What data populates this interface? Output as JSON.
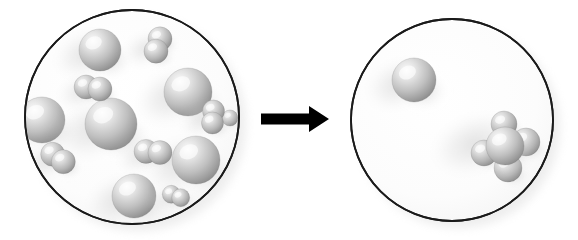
{
  "diagram": {
    "type": "before-after-reaction",
    "canvas": {
      "width": 578,
      "height": 240,
      "background": "#ffffff"
    },
    "palette": {
      "sphere_light": "#f2f2f2",
      "sphere_mid": "#bdbdbd",
      "sphere_dark": "#8a8a8a",
      "sphere_edge": "#6e6e6e",
      "vessel_fill": "#fdfdfd",
      "vessel_stroke": "#1a1a1a",
      "arrow_color": "#000000",
      "shadow_color": "#d9d9d9"
    },
    "arrow": {
      "label": "reacts to form",
      "direction": "right",
      "x1": 261,
      "x2": 329,
      "y": 119,
      "shaft_height": 11,
      "head_width": 20,
      "head_height": 26,
      "color": "#000000"
    },
    "vessels": [
      {
        "id": "reactants",
        "name": "Reactant vessel",
        "caption": "before",
        "cx": 132,
        "cy": 117,
        "r": 107,
        "stroke_width": 1.8,
        "particle_count": 13,
        "single_atom_count": 7,
        "diatomic_count": 6,
        "particles": [
          {
            "kind": "single",
            "cx": 100,
            "cy": 50,
            "r": 21
          },
          {
            "kind": "single",
            "cx": 42,
            "cy": 120,
            "r": 23
          },
          {
            "kind": "single",
            "cx": 111,
            "cy": 124,
            "r": 26
          },
          {
            "kind": "single",
            "cx": 188,
            "cy": 92,
            "r": 24
          },
          {
            "kind": "single",
            "cx": 196,
            "cy": 160,
            "r": 24
          },
          {
            "kind": "single",
            "cx": 134,
            "cy": 196,
            "r": 22
          },
          {
            "kind": "single",
            "cx": 230,
            "cy": 118,
            "r": 8
          },
          {
            "kind": "diatomic",
            "cx": 158,
            "cy": 45,
            "r": 12,
            "angle": 108,
            "sep": 13
          },
          {
            "kind": "diatomic",
            "cx": 93,
            "cy": 88,
            "r": 12,
            "angle": 8,
            "sep": 14
          },
          {
            "kind": "diatomic",
            "cx": 58,
            "cy": 158,
            "r": 12,
            "angle": 35,
            "sep": 13
          },
          {
            "kind": "diatomic",
            "cx": 153,
            "cy": 152,
            "r": 12,
            "angle": 5,
            "sep": 14
          },
          {
            "kind": "diatomic",
            "cx": 213,
            "cy": 117,
            "r": 11,
            "angle": 95,
            "sep": 12
          },
          {
            "kind": "diatomic",
            "cx": 176,
            "cy": 196,
            "r": 9,
            "angle": 20,
            "sep": 10
          }
        ]
      },
      {
        "id": "products",
        "name": "Product vessel",
        "caption": "after",
        "cx": 452,
        "cy": 120,
        "r": 101,
        "stroke_width": 1.8,
        "particle_count": 2,
        "single_atom_count": 1,
        "cluster_count": 1,
        "particles": [
          {
            "kind": "single",
            "cx": 414,
            "cy": 80,
            "r": 22
          },
          {
            "kind": "cluster",
            "cx": 505,
            "cy": 146,
            "r": 19,
            "satellites": [
              {
                "dx": -1,
                "dy": -22,
                "r": 13
              },
              {
                "dx": 21,
                "dy": -4,
                "r": 14
              },
              {
                "dx": 3,
                "dy": 22,
                "r": 14
              },
              {
                "dx": -21,
                "dy": 7,
                "r": 13
              }
            ]
          }
        ]
      }
    ]
  }
}
